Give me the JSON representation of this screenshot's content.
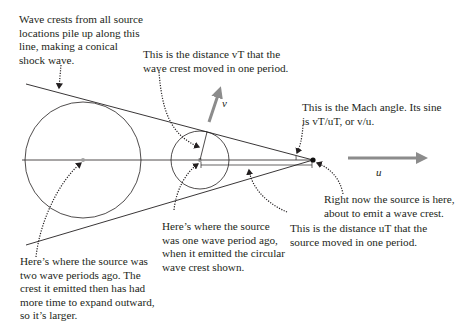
{
  "figure": {
    "annotations": {
      "shock_line": "Wave crests from all source\nlocations pile up along this\nline, making a conical\nshock wave.",
      "vT_distance": "This is the distance vT that the\nwave crest moved in one period.",
      "mach_angle_1": "This is the Mach angle. Its sine",
      "mach_angle_2": "is vT/uT, or v/u.",
      "source_now": "Right now the source is here,\nabout to emit a wave crest.",
      "uT_distance": "This is the distance uT that the\nsource moved in one period.",
      "one_period_ago": "Here’s where the source\nwas one wave period ago,\nwhen it emitted the circular\nwave crest shown.",
      "two_periods_ago": "Here’s where the source was\ntwo wave periods ago. The\ncrest it emitted then has had\nmore time to expand outward,\nso it’s larger."
    },
    "vectors": {
      "v_label": "v⃗",
      "u_label": "u⃗"
    },
    "colors": {
      "line": "#231f20",
      "arrow_gray": "#8c8c8c",
      "leader": "#231f20"
    }
  }
}
